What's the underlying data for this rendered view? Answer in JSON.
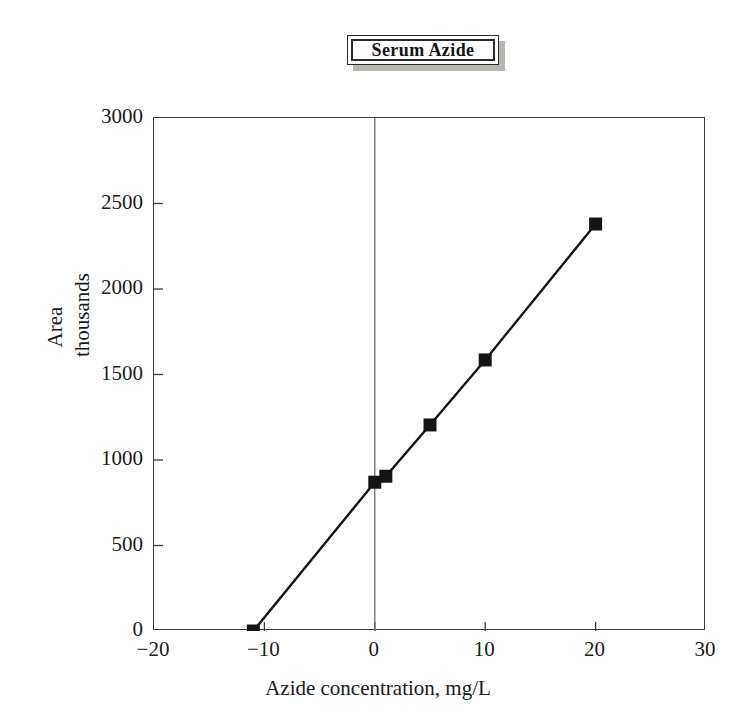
{
  "figure": {
    "title": "Serum Azide",
    "background_color": "#ffffff",
    "ink_color": "#1a1a1a"
  },
  "chart_data": {
    "type": "line",
    "title": "Serum Azide",
    "subtitle": "",
    "xlabel": "Azide concentration, mg/L",
    "ylabel_lines": [
      "Area",
      "thousands"
    ],
    "ylabel": "Area thousands",
    "xlim": [
      -20,
      30
    ],
    "ylim": [
      0,
      3000
    ],
    "xticks": [
      -20,
      -10,
      0,
      10,
      20,
      30
    ],
    "xtick_labels": [
      "−20",
      "−10",
      "0",
      "10",
      "20",
      "30"
    ],
    "yticks": [
      0,
      500,
      1000,
      1500,
      2000,
      2500,
      3000
    ],
    "ytick_labels": [
      "0",
      "500",
      "1000",
      "1500",
      "2000",
      "2500",
      "3000"
    ],
    "grid": false,
    "vertical_reference_line_x": 0,
    "legend": null,
    "marker": "filled-square",
    "marker_color": "#141414",
    "line_color": "#141414",
    "series": [
      {
        "name": "Serum Azide calibration",
        "x": [
          -11,
          0,
          1,
          5,
          10,
          20
        ],
        "y": [
          0,
          870,
          905,
          1205,
          1585,
          2380
        ]
      }
    ],
    "points": [
      {
        "x": -11,
        "y": 0
      },
      {
        "x": 0,
        "y": 870
      },
      {
        "x": 1,
        "y": 905
      },
      {
        "x": 5,
        "y": 1205
      },
      {
        "x": 10,
        "y": 1585
      },
      {
        "x": 20,
        "y": 2380
      }
    ]
  }
}
